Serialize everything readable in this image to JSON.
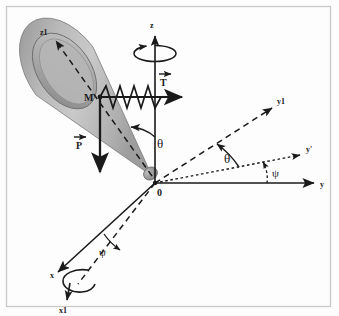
{
  "figure": {
    "background_color": "#fdfdfd",
    "frame_color": "#c9c9c9",
    "ink_color": "#1a1a1a"
  },
  "axes": {
    "z_label": "z",
    "z1_label": "z1",
    "x_label": "x",
    "x1_label": "x1",
    "y_label": "y",
    "y_prime_label": "y'",
    "y1_label": "y1"
  },
  "points": {
    "origin_label": "0",
    "mass_label": "M"
  },
  "vectors": {
    "tension_label": "T",
    "weight_label": "P"
  },
  "angles": {
    "theta_cone_label": "θ",
    "theta_plane_label": "θ",
    "psi_plane_label": "ψ",
    "psi_base_label": "ψ"
  },
  "cone": {
    "fill_light": "#c8c8c8",
    "fill_mid": "#aeaeae",
    "fill_dark": "#8a8a8a",
    "edge_color": "#6e6e6e"
  },
  "spring": {
    "coil_count": 5,
    "color": "#1a1a1a"
  }
}
